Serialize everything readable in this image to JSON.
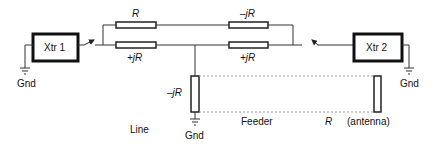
{
  "diagram": {
    "transmitters": [
      {
        "label": "Xtr 1",
        "ground_label": "Gnd"
      },
      {
        "label": "Xtr 2",
        "ground_label": "Gnd"
      }
    ],
    "resistors": {
      "top_left": "R",
      "top_right": "–jR",
      "bottom_left": "+jR",
      "bottom_right": "+jR",
      "shunt": "–jR",
      "antenna": "R"
    },
    "labels": {
      "line": "Line",
      "feeder": "Feeder",
      "antenna": "(antenna)",
      "shunt_ground": "Gnd"
    },
    "colors": {
      "line": "#222222",
      "dashed": "#888888",
      "background": "#ffffff"
    }
  }
}
